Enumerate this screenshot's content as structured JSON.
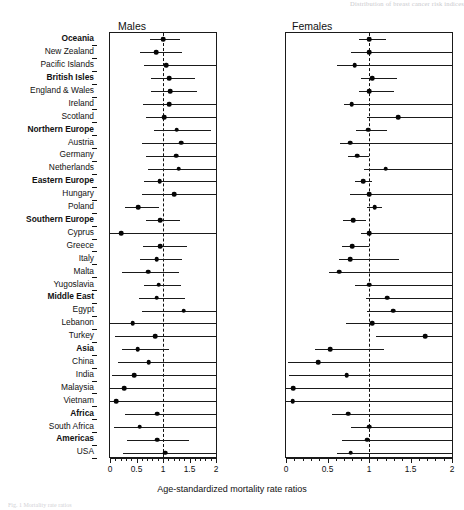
{
  "figure": {
    "running_head": "Distribution of breast cancer risk indices",
    "axis_caption": "Age-standardized mortality rate ratios",
    "caption_fragment": "Fig. 1  Mortality rate ratios",
    "panels": [
      {
        "key": "males",
        "title": "Males"
      },
      {
        "key": "females",
        "title": "Females"
      }
    ],
    "axis": {
      "min": 0,
      "max": 2,
      "null_value": 1,
      "major_ticks": [
        0,
        0.5,
        1,
        1.5,
        2
      ],
      "major_tick_labels": [
        "0",
        "0.5",
        "1",
        "1.5",
        "2"
      ],
      "minor_tick_step": 0.1
    }
  },
  "chart_data": {
    "type": "scatter",
    "xlabel": "Age-standardized mortality rate ratios",
    "ylabel": "",
    "xlim": [
      0,
      2
    ],
    "grid": false,
    "reference_line": 1,
    "legend": "none",
    "categories": [
      "Oceania",
      "New Zealand",
      "Pacific Islands",
      "British Isles",
      "England & Wales",
      "Ireland",
      "Scotland",
      "Northern Europe",
      "Austria",
      "Germany",
      "Netherlands",
      "Eastern Europe",
      "Hungary",
      "Poland",
      "Southern Europe",
      "Cyprus",
      "Greece",
      "Italy",
      "Malta",
      "Yugoslavia",
      "Middle East",
      "Egypt",
      "Lebanon",
      "Turkey",
      "Asia",
      "China",
      "India",
      "Malaysia",
      "Vietnam",
      "Africa",
      "South Africa",
      "Americas",
      "USA"
    ],
    "category_is_group": [
      true,
      false,
      false,
      true,
      false,
      false,
      false,
      true,
      false,
      false,
      false,
      true,
      false,
      false,
      true,
      false,
      false,
      false,
      false,
      false,
      true,
      false,
      false,
      false,
      true,
      false,
      false,
      false,
      false,
      true,
      false,
      true,
      false
    ],
    "series": [
      {
        "name": "Males",
        "estimates": [
          1.0,
          0.87,
          1.06,
          1.12,
          1.14,
          1.12,
          1.02,
          1.26,
          1.34,
          1.25,
          1.3,
          0.94,
          1.21,
          0.53,
          0.95,
          0.21,
          0.95,
          0.88,
          0.72,
          0.92,
          0.88,
          1.39,
          0.43,
          0.85,
          0.52,
          0.73,
          0.46,
          0.27,
          0.12,
          0.89,
          0.56,
          0.89,
          1.04
        ],
        "ci_low": [
          0.75,
          0.56,
          0.65,
          0.78,
          0.78,
          0.62,
          0.67,
          0.83,
          0.6,
          0.68,
          0.72,
          0.65,
          0.61,
          0.29,
          0.67,
          0.0,
          0.62,
          0.56,
          0.23,
          0.65,
          0.54,
          0.6,
          0.0,
          0.1,
          0.22,
          0.16,
          0.04,
          0.0,
          0.0,
          0.28,
          0.08,
          0.32,
          0.24
        ],
        "ci_high": [
          1.33,
          1.36,
          2.0,
          1.6,
          1.64,
          2.0,
          2.0,
          1.91,
          2.0,
          2.0,
          2.0,
          2.0,
          2.0,
          0.93,
          1.32,
          2.0,
          1.45,
          1.36,
          1.31,
          1.34,
          1.42,
          2.0,
          2.0,
          2.0,
          1.12,
          2.0,
          2.0,
          2.0,
          2.0,
          2.0,
          2.0,
          1.49,
          2.0
        ]
      },
      {
        "name": "Females",
        "estimates": [
          1.0,
          1.0,
          0.83,
          1.04,
          1.0,
          0.79,
          1.35,
          0.99,
          0.77,
          0.86,
          1.2,
          0.93,
          1.0,
          1.07,
          0.81,
          1.0,
          0.8,
          0.77,
          0.64,
          1.0,
          1.22,
          1.29,
          1.04,
          1.68,
          0.53,
          0.39,
          0.73,
          0.09,
          0.08,
          0.75,
          1.0,
          0.98,
          0.78
        ],
        "ci_low": [
          0.88,
          0.78,
          0.62,
          0.9,
          0.88,
          0.7,
          0.97,
          0.84,
          0.65,
          0.75,
          0.94,
          0.83,
          0.77,
          0.97,
          0.69,
          0.9,
          0.68,
          0.64,
          0.52,
          0.83,
          0.96,
          0.98,
          0.72,
          1.08,
          0.35,
          0.03,
          0.04,
          0.0,
          0.0,
          0.55,
          0.78,
          0.68,
          0.62
        ],
        "ci_high": [
          1.21,
          2.0,
          2.0,
          1.34,
          1.3,
          2.0,
          2.0,
          1.22,
          2.0,
          1.0,
          2.0,
          1.04,
          2.0,
          1.16,
          0.96,
          2.0,
          1.0,
          1.36,
          2.0,
          2.0,
          2.0,
          2.0,
          2.0,
          2.0,
          1.18,
          2.0,
          2.0,
          2.0,
          2.0,
          2.0,
          2.0,
          2.0,
          2.0
        ]
      }
    ]
  }
}
